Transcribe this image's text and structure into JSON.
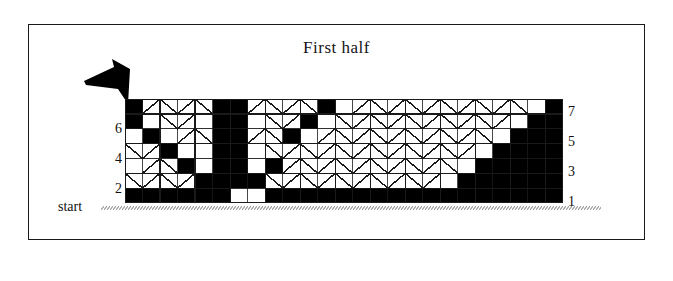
{
  "figure": {
    "title": "First  half",
    "start_label": "start",
    "border_color": "#1a1a1a",
    "fill_color": "#000000",
    "background_color": "#ffffff",
    "grid_line_color": "#1a1a1a"
  },
  "arrow": {
    "name": "direction-arrowhead",
    "points_to": "left"
  },
  "axis": {
    "left_labels": [
      "6",
      "4",
      "2"
    ],
    "right_labels": [
      "7",
      "5",
      "3",
      "1"
    ]
  },
  "chart_data": {
    "type": "heatmap",
    "title": "First  half",
    "xlabel": "",
    "ylabel": "",
    "rows": 7,
    "cols": 25,
    "cell_px": 17.5,
    "row_labels_bottom_to_top": [
      "1",
      "2",
      "3",
      "4",
      "5",
      "6",
      "7"
    ],
    "legend": [
      {
        "name": "filled-cell",
        "color": "#000000",
        "meaning": "filled square"
      },
      {
        "name": "empty-cell",
        "color": "#ffffff",
        "meaning": "empty square"
      }
    ],
    "grid": true,
    "legend_position": "none",
    "note": "filled[r] lists the zero-based column indices that are black in that row; row 1 is the bottom row",
    "filled": {
      "1": [
        0,
        1,
        2,
        3,
        4,
        5,
        8,
        9,
        10,
        11,
        12,
        13,
        14,
        15,
        16,
        17,
        18,
        19,
        20,
        21,
        22,
        23,
        24
      ],
      "2": [
        4,
        5,
        6,
        7,
        19,
        20,
        21,
        22,
        23,
        24
      ],
      "3": [
        3,
        5,
        6,
        8,
        20,
        21,
        22,
        23,
        24
      ],
      "4": [
        2,
        5,
        6,
        21,
        22,
        23,
        24
      ],
      "5": [
        1,
        5,
        6,
        9,
        22,
        23,
        24
      ],
      "6": [
        0,
        5,
        6,
        10,
        23,
        24
      ],
      "7": [
        0,
        5,
        6,
        11,
        24
      ]
    },
    "diagonals": {
      "note": "rows carrying chevron/diagonal stitch strokes drawn inside empty cells",
      "rows_with_chevrons": [
        2,
        4,
        6
      ],
      "rows_with_vertical_ticks": [
        1,
        3,
        5,
        7
      ]
    }
  }
}
